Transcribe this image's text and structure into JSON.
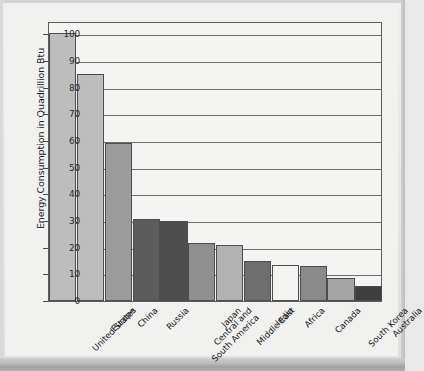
{
  "chart_data": {
    "type": "bar",
    "title": "Energy Consumption Per Year",
    "xlabel": "",
    "ylabel": "Energy Consumption in Quadrillion Btu",
    "ylim": [
      0,
      105
    ],
    "yticks": [
      0,
      10,
      20,
      30,
      40,
      50,
      60,
      70,
      80,
      90,
      100
    ],
    "grid": "horizontal",
    "legend": "none",
    "categories": [
      "United States",
      "Europe",
      "China",
      "Russia",
      "Central and\nSouth America",
      "Japan",
      "Middle East",
      "India",
      "Africa",
      "Canada",
      "South Korea",
      "Australia"
    ],
    "values": [
      100.5,
      85.2,
      59.4,
      30.8,
      30.0,
      21.7,
      21.0,
      15.0,
      13.5,
      13.2,
      8.8,
      5.5
    ],
    "bar_colors": [
      "#bdbdbd",
      "#bdbdbd",
      "#9b9b9b",
      "#5c5c5c",
      "#4e4e4e",
      "#8f8f8f",
      "#b2b2b2",
      "#6e6e6e",
      "#f4f4f2",
      "#8a8a8a",
      "#a5a5a5",
      "#3e3e3e"
    ]
  },
  "style": {
    "plot_background": "#f4f4f3",
    "axis_color": "#5d5d5d",
    "gridline_color": "#6c6c6c",
    "page_background": "#e9e9e9",
    "text_color": "#1a1a1a"
  }
}
